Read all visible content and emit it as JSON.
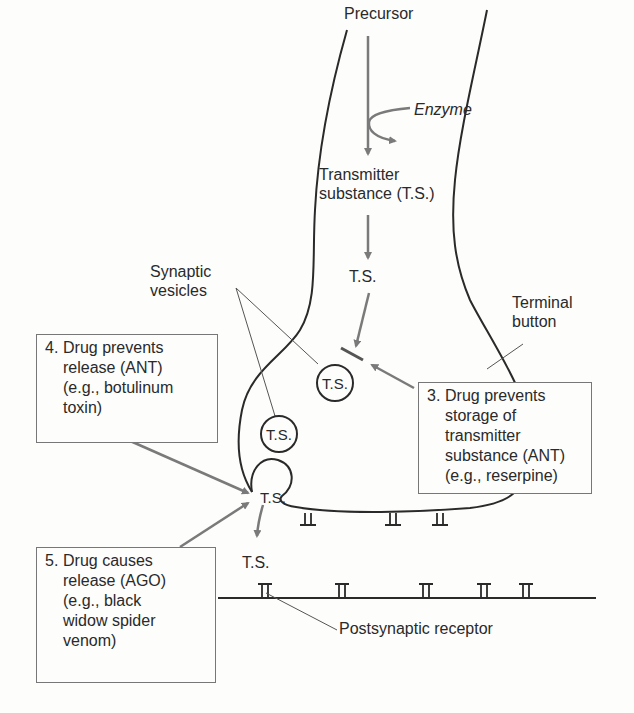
{
  "diagram": {
    "pathway": {
      "precursor": "Precursor",
      "enzyme": "Enzyme",
      "transmitter": "Transmitter\nsubstance (T.S.)",
      "ts_short": "T.S."
    },
    "labels": {
      "synaptic_vesicles": "Synaptic\nvesicles",
      "terminal_button": "Terminal\nbutton",
      "postsynaptic_receptor": "Postsynaptic receptor",
      "released_ts": "T.S."
    },
    "vesicles": [
      {
        "label": "T.S."
      },
      {
        "label": "T.S."
      },
      {
        "label": "T.S."
      }
    ],
    "boxes": [
      {
        "number": "3.",
        "text": "Drug prevents\nstorage of\ntransmitter\nsubstance (ANT)\n(e.g., reserpine)"
      },
      {
        "number": "4.",
        "text": "Drug prevents\nrelease (ANT)\n(e.g., botulinum\ntoxin)"
      },
      {
        "number": "5.",
        "text": "Drug causes\nrelease (AGO)\n(e.g., black\nwidow spider\nvenom)"
      }
    ],
    "colors": {
      "line": "#2a2a2a",
      "arrow": "#7a7a7a",
      "box_border": "#777777",
      "background": "#fdfdfb"
    }
  }
}
